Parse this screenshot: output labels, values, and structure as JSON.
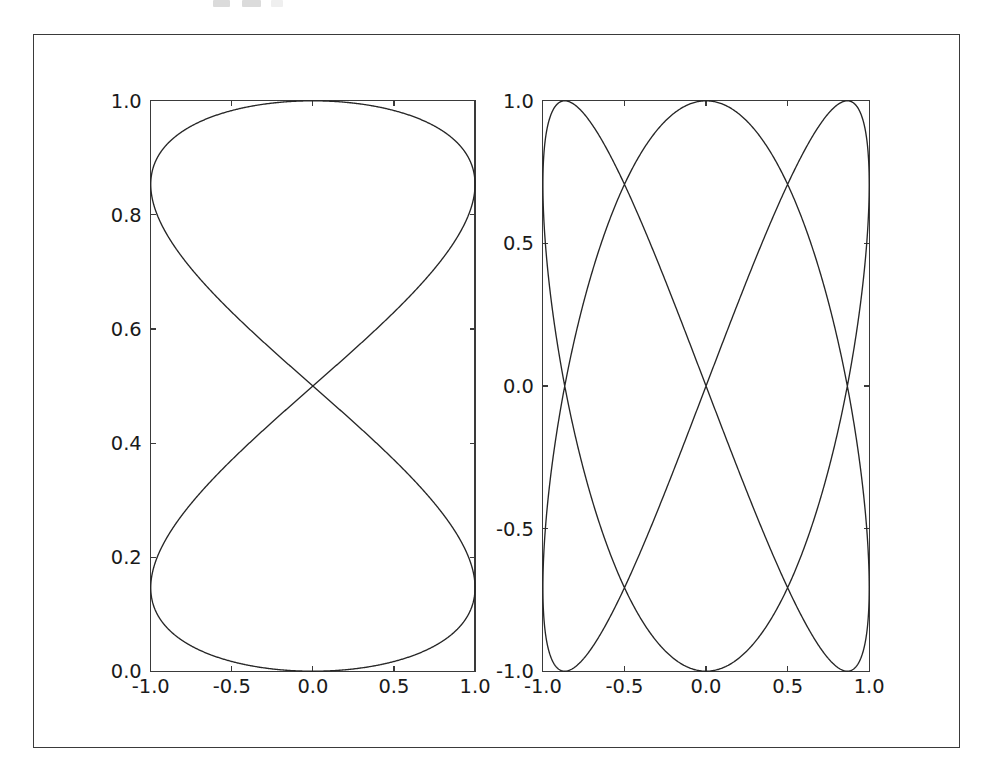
{
  "figure": {
    "background_color": "#ffffff",
    "frame_color": "#3a3a3a",
    "curve_color": "#262626",
    "tick_label_color": "#1a1a1a",
    "panel_count": 2
  },
  "chart_data": [
    {
      "panel": "left",
      "type": "line",
      "title": "",
      "xlabel": "",
      "ylabel": "",
      "xlim": [
        -1.0,
        1.0
      ],
      "ylim": [
        0.0,
        1.0
      ],
      "grid": false,
      "legend": null,
      "xticks": [
        -1.0,
        -0.5,
        0.0,
        0.5,
        1.0
      ],
      "xticklabels": [
        "-1.0",
        "-0.5",
        "0.0",
        "0.5",
        "1.0"
      ],
      "yticks": [
        0.0,
        0.2,
        0.4,
        0.6,
        0.8,
        1.0
      ],
      "yticklabels": [
        "0.0",
        "0.2",
        "0.4",
        "0.6",
        "0.8",
        "1.0"
      ],
      "curve": {
        "name": "parametric-closed-curve",
        "description": "closed parametric curve, x = sin(t), y = sin(t/2) squared-like envelope; cusp at (0.0, 0.0), apex at y = 1.0, self-crossing at (0.0, 0.707)",
        "parametric": {
          "x": "sin(t)",
          "y": "(1 - cos(t)) / 2 blended",
          "t_range": [
            0,
            12.566370614
          ]
        },
        "key_points": [
          {
            "label": "bottom-cusp",
            "x": 0.0,
            "y": 0.0
          },
          {
            "label": "self-crossing",
            "x": 0.0,
            "y": 0.707
          },
          {
            "label": "top-apex",
            "x": 0.0,
            "y": 1.0
          },
          {
            "label": "left-edge-upper",
            "x": -1.0,
            "y": 0.92
          },
          {
            "label": "left-edge-lower",
            "x": -1.0,
            "y": 0.39
          },
          {
            "label": "right-edge-upper",
            "x": 1.0,
            "y": 0.92
          },
          {
            "label": "right-edge-lower",
            "x": 1.0,
            "y": 0.39
          }
        ]
      }
    },
    {
      "panel": "right",
      "type": "line",
      "title": "",
      "xlabel": "",
      "ylabel": "",
      "xlim": [
        -1.0,
        1.0
      ],
      "ylim": [
        -1.0,
        1.0
      ],
      "grid": false,
      "legend": null,
      "xticks": [
        -1.0,
        -0.5,
        0.0,
        0.5,
        1.0
      ],
      "xticklabels": [
        "-1.0",
        "-0.5",
        "0.0",
        "0.5",
        "1.0"
      ],
      "yticks": [
        -1.0,
        -0.5,
        0.0,
        0.5,
        1.0
      ],
      "yticklabels": [
        "-1.0",
        "-0.5",
        "0.0",
        "0.5",
        "1.0"
      ],
      "curve": {
        "name": "lissajous-3-2",
        "description": "Lissajous curve, x = sin(2t), y = sin(3t) style; two self-crossings on the vertical centre line at y = 0.5 and y = -0.5",
        "parametric": {
          "x": "sin(2t)",
          "y": "sin(3t)",
          "t_range": [
            0,
            6.283185307
          ]
        },
        "key_points": [
          {
            "label": "upper-self-crossing",
            "x": 0.0,
            "y": 0.5
          },
          {
            "label": "lower-self-crossing",
            "x": 0.0,
            "y": -0.5
          },
          {
            "label": "top-apex",
            "x": 0.0,
            "y": 1.0
          },
          {
            "label": "bottom-apex",
            "x": 0.0,
            "y": -1.0
          },
          {
            "label": "left-edge-upper",
            "x": -1.0,
            "y": 0.87
          },
          {
            "label": "left-edge-middle",
            "x": -1.0,
            "y": 0.0
          },
          {
            "label": "left-edge-lower",
            "x": -1.0,
            "y": -0.87
          },
          {
            "label": "right-edge-upper",
            "x": 1.0,
            "y": 0.87
          },
          {
            "label": "right-edge-middle",
            "x": 1.0,
            "y": 0.0
          },
          {
            "label": "right-edge-lower",
            "x": 1.0,
            "y": -0.87
          }
        ]
      }
    }
  ]
}
